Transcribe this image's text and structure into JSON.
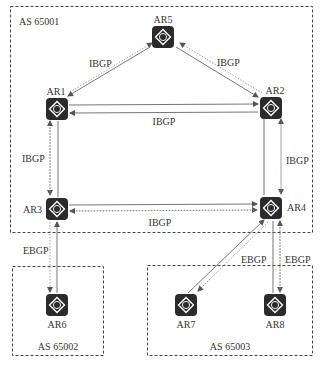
{
  "diagram": {
    "colors": {
      "router_fill": "#2b2b2b",
      "router_glyph": "#ffffff",
      "line": "#666666",
      "box_border": "#444444",
      "text": "#333333"
    },
    "as_boxes": [
      {
        "id": "as65001",
        "label": "AS 65001"
      },
      {
        "id": "as65002",
        "label": "AS 65002"
      },
      {
        "id": "as65003",
        "label": "AS 65003"
      }
    ],
    "routers": [
      {
        "id": "AR1",
        "label": "AR1",
        "icon": "router-icon"
      },
      {
        "id": "AR2",
        "label": "AR2",
        "icon": "router-icon"
      },
      {
        "id": "AR3",
        "label": "AR3",
        "icon": "router-icon"
      },
      {
        "id": "AR4",
        "label": "AR4",
        "icon": "router-icon"
      },
      {
        "id": "AR5",
        "label": "AR5",
        "icon": "router-icon"
      },
      {
        "id": "AR6",
        "label": "AR6",
        "icon": "router-icon"
      },
      {
        "id": "AR7",
        "label": "AR7",
        "icon": "router-icon"
      },
      {
        "id": "AR8",
        "label": "AR8",
        "icon": "router-icon"
      }
    ],
    "peerings": [
      {
        "from": "AR5",
        "to": "AR1",
        "label": "IBGP"
      },
      {
        "from": "AR5",
        "to": "AR2",
        "label": "IBGP"
      },
      {
        "from": "AR1",
        "to": "AR2",
        "label": "IBGP"
      },
      {
        "from": "AR1",
        "to": "AR3",
        "label": "IBGP"
      },
      {
        "from": "AR2",
        "to": "AR4",
        "label": "IBGP"
      },
      {
        "from": "AR3",
        "to": "AR4",
        "label": "IBGP"
      },
      {
        "from": "AR3",
        "to": "AR6",
        "label": "EBGP"
      },
      {
        "from": "AR4",
        "to": "AR7",
        "label": "EBGP"
      },
      {
        "from": "AR4",
        "to": "AR8",
        "label": "EBGP"
      }
    ],
    "router_glyph": "R"
  }
}
